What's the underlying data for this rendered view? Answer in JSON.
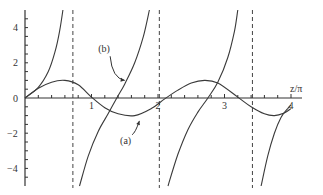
{
  "chart_data": {
    "type": "line",
    "title": "",
    "xlabel": "z/π",
    "ylabel": "",
    "xlim": [
      0,
      4.15
    ],
    "ylim": [
      -5,
      5
    ],
    "grid": false,
    "x_ticks": [
      {
        "value": 1,
        "label": "1"
      },
      {
        "value": 2,
        "label": "2"
      },
      {
        "value": 3,
        "label": "3"
      },
      {
        "value": 4,
        "label": "4"
      }
    ],
    "y_ticks": [
      {
        "value": 4,
        "label": "4"
      },
      {
        "value": 2,
        "label": "2"
      },
      {
        "value": 0,
        "label": "0"
      },
      {
        "value": -2,
        "label": "−2"
      },
      {
        "value": -4,
        "label": "−4"
      }
    ],
    "asymptotes_x": [
      0.72,
      2.02,
      3.42
    ],
    "series": [
      {
        "name": "(a)",
        "style": "solid",
        "x": [
          0,
          0.2,
          0.4,
          0.6,
          0.8,
          1.0,
          1.2,
          1.4,
          1.65,
          1.9,
          2.1,
          2.3,
          2.5,
          2.7,
          2.9,
          3.2,
          3.4,
          3.6,
          3.75,
          3.9,
          4.0
        ],
        "y": [
          0,
          0.55,
          0.9,
          1.0,
          0.75,
          0.05,
          -0.55,
          -0.9,
          -1.0,
          -0.6,
          -0.05,
          0.45,
          0.85,
          1.0,
          0.85,
          0.05,
          -0.5,
          -0.9,
          -1.0,
          -0.85,
          -0.6
        ]
      },
      {
        "name": "(b)",
        "style": "solid",
        "branches": [
          {
            "x": [
              0,
              0.2,
              0.35,
              0.45,
              0.52,
              0.57
            ],
            "y": [
              0,
              0.6,
              1.5,
              2.6,
              3.8,
              5.0
            ]
          },
          {
            "x": [
              0.82,
              0.95,
              1.1,
              1.25,
              1.38,
              1.5,
              1.65,
              1.78,
              1.87
            ],
            "y": [
              -5.0,
              -3.3,
              -1.9,
              -0.9,
              0,
              0.8,
              2.0,
              3.5,
              5.0
            ]
          },
          {
            "x": [
              2.15,
              2.3,
              2.45,
              2.6,
              2.75,
              2.9,
              3.05,
              3.15,
              3.2
            ],
            "y": [
              -5.0,
              -3.2,
              -1.8,
              -0.8,
              0,
              0.9,
              2.3,
              3.8,
              5.0
            ]
          },
          {
            "x": [
              3.55,
              3.65,
              3.75,
              3.85,
              3.95,
              4.0
            ],
            "y": [
              -5.0,
              -3.3,
              -2.0,
              -1.1,
              -0.6,
              -0.4
            ]
          }
        ]
      }
    ],
    "annotations": [
      {
        "text": "(a)",
        "x": 1.55,
        "y": -2.6,
        "arrow_to": [
          1.72,
          -1.3
        ]
      },
      {
        "text": "(b)",
        "x": 1.22,
        "y": 2.6,
        "arrow_to": [
          1.5,
          1.0
        ]
      }
    ]
  }
}
